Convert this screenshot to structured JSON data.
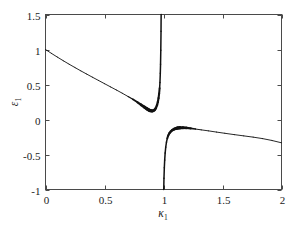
{
  "chart_data": {
    "type": "line",
    "title": "",
    "xlabel": "κ₁",
    "ylabel": "ε₁",
    "xlabel_base": "κ",
    "xlabel_sub": "1",
    "ylabel_base": "ε",
    "ylabel_sub": "1",
    "xlim": [
      0,
      2
    ],
    "ylim": [
      -1,
      1.5
    ],
    "xticks": [
      0,
      0.5,
      1,
      1.5,
      2
    ],
    "xticklabels": [
      "0",
      "0.5",
      "1",
      "1.5",
      "2"
    ],
    "yticks": [
      -1,
      -0.5,
      0,
      0.5,
      1,
      1.5
    ],
    "yticklabels": [
      "-1",
      "-0.5",
      "0",
      "0.5",
      "1",
      "1.5"
    ],
    "grid": false,
    "legend": null,
    "asymptote_x": 1,
    "series": [
      {
        "name": "upper-branch",
        "comment": "left branch, starts at (0,1), dips to minimum then diverges to +1.5 as kappa approaches 1 from below",
        "x": [
          0.0,
          0.05,
          0.1,
          0.15,
          0.2,
          0.25,
          0.3,
          0.35,
          0.4,
          0.45,
          0.5,
          0.55,
          0.6,
          0.65,
          0.7,
          0.74,
          0.78,
          0.81,
          0.84,
          0.86,
          0.875,
          0.885,
          0.895,
          0.905,
          0.915,
          0.925,
          0.935,
          0.945,
          0.952,
          0.958,
          0.963,
          0.967,
          0.97,
          0.973,
          0.975,
          0.977,
          0.979,
          0.98
        ],
        "y": [
          1.0,
          0.945,
          0.892,
          0.84,
          0.79,
          0.742,
          0.694,
          0.648,
          0.602,
          0.557,
          0.512,
          0.467,
          0.422,
          0.376,
          0.328,
          0.288,
          0.245,
          0.21,
          0.175,
          0.152,
          0.137,
          0.129,
          0.124,
          0.122,
          0.126,
          0.138,
          0.162,
          0.205,
          0.25,
          0.305,
          0.37,
          0.445,
          0.53,
          0.66,
          0.79,
          0.99,
          1.26,
          1.5
        ]
      },
      {
        "name": "lower-branch",
        "comment": "right branch, rises from -1 just above kappa=1, peaks near -0.11, then decays slowly to about -0.33 at kappa=2",
        "x": [
          1.002,
          1.004,
          1.007,
          1.01,
          1.014,
          1.019,
          1.025,
          1.032,
          1.04,
          1.05,
          1.062,
          1.075,
          1.09,
          1.105,
          1.12,
          1.14,
          1.165,
          1.195,
          1.23,
          1.27,
          1.32,
          1.38,
          1.45,
          1.52,
          1.6,
          1.68,
          1.76,
          1.84,
          1.92,
          2.0
        ],
        "y": [
          -1.0,
          -0.84,
          -0.69,
          -0.58,
          -0.48,
          -0.395,
          -0.325,
          -0.27,
          -0.228,
          -0.195,
          -0.17,
          -0.152,
          -0.138,
          -0.128,
          -0.122,
          -0.118,
          -0.117,
          -0.12,
          -0.127,
          -0.136,
          -0.148,
          -0.162,
          -0.18,
          -0.197,
          -0.216,
          -0.234,
          -0.252,
          -0.273,
          -0.3,
          -0.333
        ]
      }
    ]
  },
  "axes": {
    "frame_color": "#4a4a4a",
    "curve_color": "#111111",
    "background": "#ffffff"
  }
}
